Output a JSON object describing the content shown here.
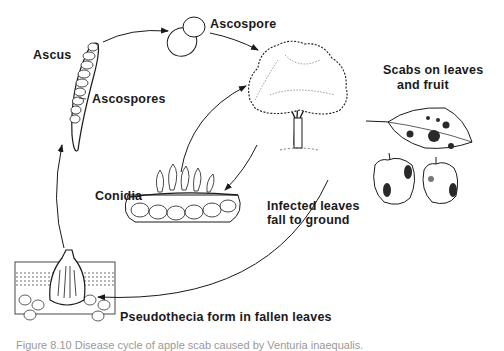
{
  "diagram": {
    "type": "disease-cycle",
    "labels": {
      "ascus": "Ascus",
      "ascospores": "Ascospores",
      "ascospore": "Ascospore",
      "scabs_line1": "Scabs on leaves",
      "scabs_line2": "and fruit",
      "conidia": "Conidia",
      "infected_line1": "Infected leaves",
      "infected_line2": "fall to ground",
      "pseudothecia": "Pseudothecia form in fallen leaves"
    },
    "caption": "Figure 8.10 Disease cycle of apple scab caused by Venturia inaequalis.",
    "stages": [
      "Ascus",
      "Ascospore",
      "Infected tree",
      "Scabs on leaves and fruit",
      "Infected leaves fall to ground",
      "Pseudothecia form in fallen leaves",
      "Conidia"
    ],
    "colors": {
      "ink": "#1a1a1a",
      "background": "#ffffff"
    }
  }
}
